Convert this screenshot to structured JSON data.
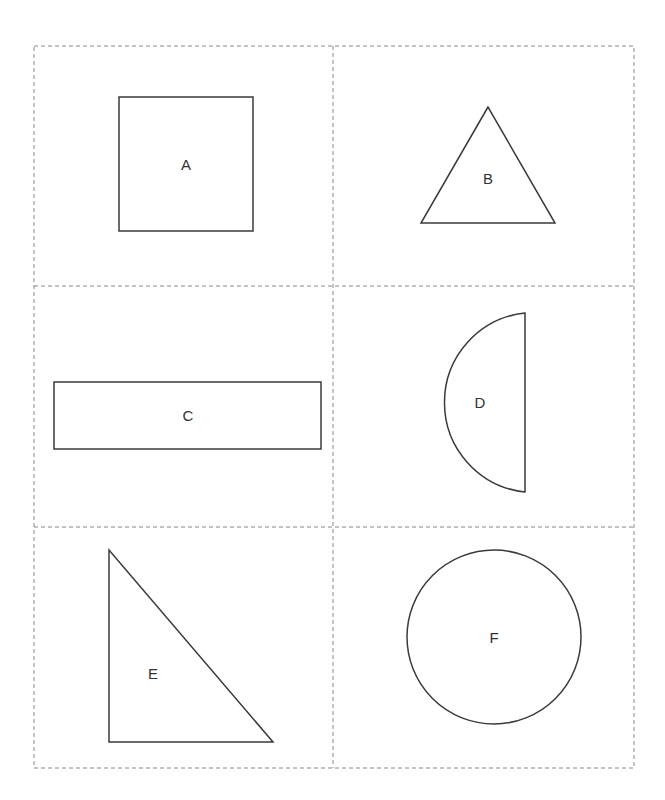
{
  "page": {
    "background": "#ffffff",
    "top_fragment_text": ""
  },
  "grid": {
    "rows": 3,
    "columns": 2,
    "border_style": "dashed",
    "border_color": "#888888"
  },
  "shapes": [
    {
      "label": "A",
      "type": "square",
      "cell": "row1-col1"
    },
    {
      "label": "B",
      "type": "equilateral-triangle",
      "cell": "row1-col2"
    },
    {
      "label": "C",
      "type": "rectangle",
      "cell": "row2-col1"
    },
    {
      "label": "D",
      "type": "semicircle",
      "cell": "row2-col2"
    },
    {
      "label": "E",
      "type": "right-triangle",
      "cell": "row3-col1"
    },
    {
      "label": "F",
      "type": "circle",
      "cell": "row3-col2"
    }
  ]
}
